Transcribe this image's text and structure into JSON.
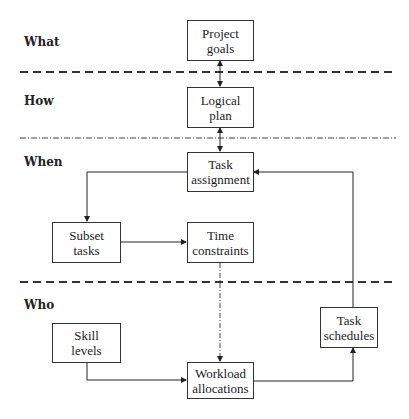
{
  "lanes": [
    {
      "label": "What"
    },
    {
      "label": "How"
    },
    {
      "label": "When"
    },
    {
      "label": "Who"
    }
  ],
  "nodes": {
    "project_goals": "Project\ngoals",
    "logical_plan": "Logical\nplan",
    "task_assignment": "Task\nassignment",
    "subset_tasks": "Subset\ntasks",
    "time_constraints": "Time\nconstraints",
    "skill_levels": "Skill\nlevels",
    "workload_allocations": "Workload\nallocations",
    "task_schedules": "Task\nschedules"
  },
  "edges": [
    {
      "from": "project_goals",
      "to": "logical_plan",
      "style": "solid",
      "direction": "both"
    },
    {
      "from": "logical_plan",
      "to": "task_assignment",
      "style": "solid",
      "direction": "both"
    },
    {
      "from": "task_assignment",
      "to": "subset_tasks",
      "style": "solid",
      "direction": "forward"
    },
    {
      "from": "subset_tasks",
      "to": "time_constraints",
      "style": "solid",
      "direction": "forward"
    },
    {
      "from": "time_constraints",
      "to": "workload_allocations",
      "style": "dash-dot",
      "direction": "forward"
    },
    {
      "from": "skill_levels",
      "to": "workload_allocations",
      "style": "solid",
      "direction": "forward"
    },
    {
      "from": "workload_allocations",
      "to": "task_schedules",
      "style": "solid",
      "direction": "forward"
    },
    {
      "from": "task_schedules",
      "to": "task_assignment",
      "style": "solid",
      "direction": "forward"
    }
  ],
  "separators": [
    {
      "between": [
        "What",
        "How"
      ],
      "style": "dashed"
    },
    {
      "between": [
        "How",
        "When"
      ],
      "style": "dash-dot"
    },
    {
      "between": [
        "When",
        "Who"
      ],
      "style": "dashed"
    }
  ]
}
